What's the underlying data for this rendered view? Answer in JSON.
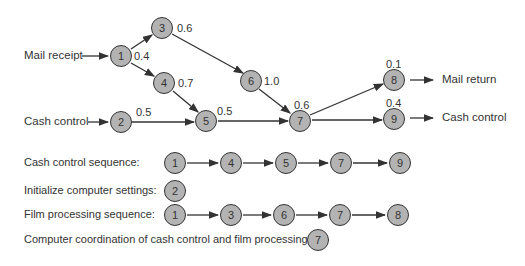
{
  "network": {
    "inputs": {
      "mail_receipt": "Mail receipt",
      "cash_control": "Cash control"
    },
    "outputs": {
      "mail_return": "Mail return",
      "cash_control": "Cash control"
    },
    "nodes": [
      {
        "id": "1",
        "weight": "0.4"
      },
      {
        "id": "2",
        "weight": "0.5"
      },
      {
        "id": "3",
        "weight": "0.6"
      },
      {
        "id": "4",
        "weight": "0.7"
      },
      {
        "id": "5",
        "weight": "0.5"
      },
      {
        "id": "6",
        "weight": "1.0"
      },
      {
        "id": "7",
        "weight": "0.6"
      },
      {
        "id": "8",
        "weight": "0.1"
      },
      {
        "id": "9",
        "weight": "0.4"
      }
    ],
    "edges": [
      [
        "1",
        "3"
      ],
      [
        "1",
        "4"
      ],
      [
        "3",
        "6"
      ],
      [
        "4",
        "5"
      ],
      [
        "2",
        "5"
      ],
      [
        "6",
        "7"
      ],
      [
        "5",
        "7"
      ],
      [
        "7",
        "8"
      ],
      [
        "7",
        "9"
      ]
    ]
  },
  "sequences": [
    {
      "label": "Cash control sequence:",
      "nodes": [
        "1",
        "4",
        "5",
        "7",
        "9"
      ]
    },
    {
      "label": "Initialize computer settings:",
      "nodes": [
        "2"
      ]
    },
    {
      "label": "Film processing sequence:",
      "nodes": [
        "1",
        "3",
        "6",
        "7",
        "8"
      ]
    },
    {
      "label": "Computer coordination of cash control and film processing:",
      "nodes": [
        "7"
      ]
    }
  ]
}
